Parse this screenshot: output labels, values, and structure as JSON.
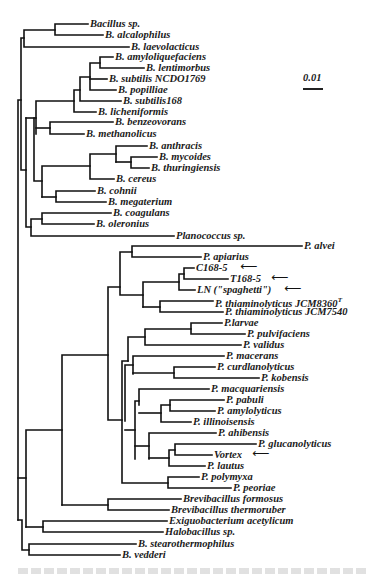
{
  "figure": {
    "type": "phylogenetic-tree",
    "scale_bar": {
      "label": "0.01"
    },
    "caption_visible": false
  },
  "leaves": [
    {
      "label": "Bacillus sp.",
      "x": 90,
      "y": 24
    },
    {
      "label": "B. alcalophilus",
      "x": 105,
      "y": 35
    },
    {
      "label": "B. laevolacticus",
      "x": 131,
      "y": 47
    },
    {
      "label": "B. amyloliquefaciens",
      "x": 115,
      "y": 57
    },
    {
      "label": "B. lentimorbus",
      "x": 146,
      "y": 68
    },
    {
      "label": "B. subtilis NCDO1769",
      "x": 109,
      "y": 79
    },
    {
      "label": "B. popilliae",
      "x": 118,
      "y": 90
    },
    {
      "label": "B. subtilis168",
      "x": 123,
      "y": 101
    },
    {
      "label": "B. licheniformis",
      "x": 98,
      "y": 112
    },
    {
      "label": "B. benzeovorans",
      "x": 115,
      "y": 122
    },
    {
      "label": "B. methanolicus",
      "x": 86,
      "y": 134
    },
    {
      "label": "B. anthracis",
      "x": 149,
      "y": 146
    },
    {
      "label": "B. mycoides",
      "x": 159,
      "y": 157
    },
    {
      "label": "B. thuringiensis",
      "x": 151,
      "y": 168
    },
    {
      "label": "B. cereus",
      "x": 116,
      "y": 179
    },
    {
      "label": "B. cohnii",
      "x": 97,
      "y": 191
    },
    {
      "label": "B. megaterium",
      "x": 108,
      "y": 202
    },
    {
      "label": "B. coagulans",
      "x": 113,
      "y": 213
    },
    {
      "label": "B. oleronius",
      "x": 96,
      "y": 224
    },
    {
      "label": "Planococcus sp.",
      "x": 176,
      "y": 236
    },
    {
      "label": "P. alvei",
      "x": 304,
      "y": 246
    },
    {
      "label": "P. apiarius",
      "x": 203,
      "y": 257
    },
    {
      "label": "C168-5",
      "x": 196,
      "y": 268,
      "arrow": true
    },
    {
      "label": "T168-5",
      "x": 230,
      "y": 279,
      "arrow": true
    },
    {
      "label": "LN (\"spaghetti\")",
      "x": 197,
      "y": 290,
      "arrow": true
    },
    {
      "label": "P. thiaminolyticus JCM8360",
      "sup": "T",
      "x": 215,
      "y": 301
    },
    {
      "label": "P. thiaminolyticus JCM7540",
      "x": 225,
      "y": 312
    },
    {
      "label": "P.larvae",
      "x": 224,
      "y": 323
    },
    {
      "label": "P. pulvifaciens",
      "x": 247,
      "y": 334
    },
    {
      "label": "P. validus",
      "x": 243,
      "y": 345
    },
    {
      "label": "P. macerans",
      "x": 226,
      "y": 356
    },
    {
      "label": "P. curdlanolyticus",
      "x": 217,
      "y": 367
    },
    {
      "label": "P. kobensis",
      "x": 261,
      "y": 378
    },
    {
      "label": "P. macquariensis",
      "x": 211,
      "y": 389
    },
    {
      "label": "P. pabuli",
      "x": 226,
      "y": 400
    },
    {
      "label": "P. amylolyticus",
      "x": 217,
      "y": 411
    },
    {
      "label": "P. illinoisensis",
      "x": 193,
      "y": 422
    },
    {
      "label": "P. ahibensis",
      "x": 218,
      "y": 433
    },
    {
      "label": "P. glucanolyticus",
      "x": 258,
      "y": 444
    },
    {
      "label": "Vortex",
      "x": 214,
      "y": 455,
      "arrow": true
    },
    {
      "label": "P. lautus",
      "x": 207,
      "y": 466
    },
    {
      "label": "P. polymyxa",
      "x": 201,
      "y": 477
    },
    {
      "label": "P. peoriae",
      "x": 233,
      "y": 488
    },
    {
      "label": "Brevibacillus formosus",
      "x": 183,
      "y": 499
    },
    {
      "label": "Brevibacillus thermoruber",
      "x": 171,
      "y": 510
    },
    {
      "label": "Exiguobacterium acetylicum",
      "x": 169,
      "y": 521
    },
    {
      "label": "Halobacillus sp.",
      "x": 165,
      "y": 532
    },
    {
      "label": "B. stearothermophilus",
      "x": 138,
      "y": 544
    },
    {
      "label": "B. vedderi",
      "x": 122,
      "y": 555
    }
  ],
  "arrows": [
    {
      "for": "C168-5",
      "x": 240,
      "y": 268
    },
    {
      "for": "T168-5",
      "x": 271,
      "y": 279
    },
    {
      "label_for": "LN",
      "x": 284,
      "y": 290
    },
    {
      "for": "Vortex",
      "x": 252,
      "y": 455
    }
  ],
  "branches": [
    [
      88,
      24,
      55,
      24
    ],
    [
      55,
      24,
      55,
      35
    ],
    [
      55,
      35,
      103,
      35
    ],
    [
      55,
      30,
      24,
      30
    ],
    [
      24,
      30,
      24,
      47
    ],
    [
      24,
      47,
      129,
      47
    ],
    [
      113,
      57,
      100,
      57
    ],
    [
      100,
      57,
      100,
      68
    ],
    [
      100,
      68,
      144,
      68
    ],
    [
      100,
      62,
      90,
      62
    ],
    [
      90,
      62,
      90,
      90
    ],
    [
      90,
      79,
      107,
      79
    ],
    [
      90,
      90,
      116,
      90
    ],
    [
      90,
      76,
      80,
      76
    ],
    [
      80,
      76,
      80,
      101
    ],
    [
      80,
      101,
      121,
      101
    ],
    [
      80,
      90,
      74,
      90
    ],
    [
      74,
      90,
      74,
      112
    ],
    [
      74,
      112,
      96,
      112
    ],
    [
      74,
      100,
      36,
      100
    ],
    [
      36,
      100,
      36,
      134
    ],
    [
      113,
      122,
      50,
      122
    ],
    [
      50,
      122,
      50,
      134
    ],
    [
      50,
      134,
      84,
      134
    ],
    [
      50,
      128,
      36,
      128
    ],
    [
      147,
      146,
      116,
      146
    ],
    [
      116,
      146,
      116,
      162
    ],
    [
      131,
      157,
      157,
      157
    ],
    [
      131,
      157,
      131,
      168
    ],
    [
      131,
      168,
      149,
      168
    ],
    [
      116,
      162,
      131,
      162
    ],
    [
      116,
      154,
      90,
      154
    ],
    [
      90,
      154,
      90,
      179
    ],
    [
      90,
      179,
      114,
      179
    ],
    [
      90,
      166,
      42,
      166
    ],
    [
      42,
      166,
      42,
      196
    ],
    [
      95,
      191,
      56,
      191
    ],
    [
      56,
      191,
      56,
      202
    ],
    [
      56,
      202,
      106,
      202
    ],
    [
      56,
      196,
      42,
      196
    ],
    [
      42,
      180,
      34,
      180
    ],
    [
      34,
      180,
      34,
      220
    ],
    [
      111,
      213,
      42,
      213
    ],
    [
      42,
      213,
      42,
      224
    ],
    [
      42,
      224,
      94,
      224
    ],
    [
      42,
      218,
      30,
      218
    ],
    [
      30,
      218,
      30,
      236
    ],
    [
      30,
      236,
      174,
      236
    ],
    [
      34,
      200,
      26,
      200
    ],
    [
      26,
      200,
      26,
      224
    ],
    [
      36,
      115,
      26,
      115
    ],
    [
      26,
      115,
      26,
      210
    ],
    [
      24,
      38,
      19,
      38
    ],
    [
      19,
      38,
      19,
      160
    ],
    [
      19,
      160,
      17,
      160
    ],
    [
      17,
      160,
      17,
      535
    ]
  ],
  "colors": {
    "ink": "#111111",
    "background": "#ffffff"
  }
}
